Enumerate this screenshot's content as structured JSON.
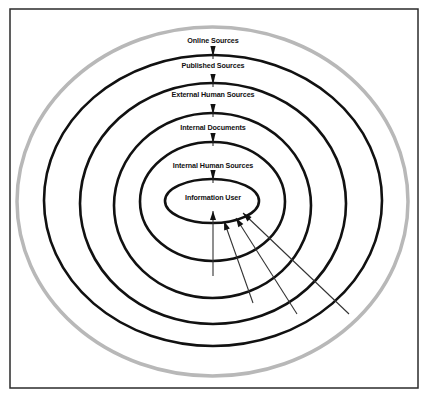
{
  "diagram": {
    "frame": {
      "x": 10,
      "y": 9,
      "width": 408,
      "height": 379,
      "color": "#2b2b2b"
    },
    "rings": [
      {
        "id": "online",
        "label": "Online Sources",
        "cx": 212.5,
        "cy": 201.5,
        "rx": 195.5,
        "ry": 174.5,
        "color": "#b8b8b8",
        "label_y": 43
      },
      {
        "id": "published",
        "label": "Published Sources",
        "cx": 213,
        "cy": 200.5,
        "rx": 169,
        "ry": 145.5,
        "color": "#111111",
        "label_y": 68
      },
      {
        "id": "external-human",
        "label": "External Human Sources",
        "cx": 213,
        "cy": 203.5,
        "rx": 133,
        "ry": 120.5,
        "color": "#111111",
        "label_y": 97
      },
      {
        "id": "internal-documents",
        "label": "Internal Documents",
        "cx": 212.5,
        "cy": 205.5,
        "rx": 98.5,
        "ry": 92.5,
        "color": "#111111",
        "label_y": 130
      },
      {
        "id": "internal-human",
        "label": "Internal Human Sources",
        "cx": 212.5,
        "cy": 201.5,
        "rx": 72.5,
        "ry": 59.5,
        "color": "#111111",
        "label_y": 168
      },
      {
        "id": "information-user",
        "label": "Information User",
        "cx": 212,
        "cy": 201,
        "rx": 47,
        "ry": 22,
        "color": "#111111",
        "label_y": 200
      }
    ],
    "down_arrows": [
      {
        "x": 213,
        "top": 46,
        "bottom": 59
      },
      {
        "x": 213,
        "top": 74,
        "bottom": 87
      },
      {
        "x": 213,
        "top": 104,
        "bottom": 117
      },
      {
        "x": 213,
        "top": 133,
        "bottom": 146
      },
      {
        "x": 213,
        "top": 170,
        "bottom": 183
      }
    ],
    "inbound_arrows": [
      {
        "from": [
          213,
          276
        ],
        "to": [
          213,
          211
        ]
      },
      {
        "from": [
          253,
          303
        ],
        "to": [
          224,
          221
        ]
      },
      {
        "from": [
          297,
          314
        ],
        "to": [
          236,
          218
        ]
      },
      {
        "from": [
          349,
          314
        ],
        "to": [
          243,
          213
        ]
      }
    ]
  }
}
